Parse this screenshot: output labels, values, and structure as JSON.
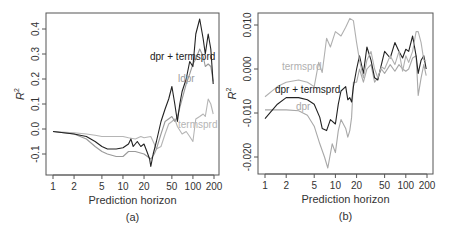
{
  "chart_data": [
    {
      "type": "line",
      "panel_label": "(a)",
      "xlabel": "Prediction horizon",
      "ylabel": "R²",
      "xscale": "log",
      "xlim": [
        1,
        200
      ],
      "ylim": [
        -0.16,
        0.44
      ],
      "xticks": [
        "1",
        "2",
        "5",
        "10",
        "20",
        "50",
        "100",
        "200"
      ],
      "xtick_values": [
        1,
        2,
        5,
        10,
        20,
        50,
        100,
        200
      ],
      "yticks": [
        "-0.1",
        "0.0",
        "0.1",
        "0.2",
        "0.3",
        "0.4"
      ],
      "ytick_values": [
        -0.1,
        0.0,
        0.1,
        0.2,
        0.3,
        0.4
      ],
      "grid": false,
      "series": [
        {
          "name": "dpr + termsprd",
          "color": "#222222",
          "label_pos": [
            150,
            60
          ],
          "points": [
            [
              1,
              -0.01
            ],
            [
              2,
              -0.02
            ],
            [
              3,
              -0.03
            ],
            [
              4,
              -0.05
            ],
            [
              5,
              -0.07
            ],
            [
              6,
              -0.08
            ],
            [
              8,
              -0.08
            ],
            [
              10,
              -0.075
            ],
            [
              12,
              -0.06
            ],
            [
              13,
              -0.04
            ],
            [
              14,
              -0.07
            ],
            [
              16,
              -0.05
            ],
            [
              18,
              -0.07
            ],
            [
              20,
              -0.06
            ],
            [
              22,
              -0.09
            ],
            [
              24,
              -0.12
            ],
            [
              25,
              -0.15
            ],
            [
              27,
              -0.1
            ],
            [
              30,
              -0.05
            ],
            [
              35,
              0.03
            ],
            [
              40,
              0.08
            ],
            [
              45,
              0.12
            ],
            [
              50,
              0.17
            ],
            [
              55,
              0.1
            ],
            [
              60,
              0.03
            ],
            [
              65,
              0.1
            ],
            [
              70,
              0.15
            ],
            [
              80,
              0.2
            ],
            [
              90,
              0.27
            ],
            [
              100,
              0.25
            ],
            [
              110,
              0.38
            ],
            [
              125,
              0.44
            ],
            [
              140,
              0.36
            ],
            [
              150,
              0.3
            ],
            [
              165,
              0.38
            ],
            [
              180,
              0.32
            ],
            [
              195,
              0.18
            ]
          ]
        },
        {
          "name": "ldpr",
          "color": "#9a9a9a",
          "label_pos": [
            178,
            82
          ],
          "points": [
            [
              1,
              -0.01
            ],
            [
              2,
              -0.02
            ],
            [
              3,
              -0.04
            ],
            [
              4,
              -0.07
            ],
            [
              5,
              -0.09
            ],
            [
              6,
              -0.1
            ],
            [
              8,
              -0.11
            ],
            [
              10,
              -0.11
            ],
            [
              12,
              -0.09
            ],
            [
              15,
              -0.09
            ],
            [
              20,
              -0.1
            ],
            [
              25,
              -0.12
            ],
            [
              28,
              -0.1
            ],
            [
              30,
              -0.08
            ],
            [
              35,
              -0.02
            ],
            [
              40,
              0.03
            ],
            [
              50,
              0.05
            ],
            [
              55,
              0.03
            ],
            [
              60,
              0.05
            ],
            [
              70,
              0.12
            ],
            [
              80,
              0.18
            ],
            [
              90,
              0.22
            ],
            [
              100,
              0.26
            ],
            [
              110,
              0.28
            ],
            [
              125,
              0.32
            ],
            [
              140,
              0.29
            ],
            [
              150,
              0.25
            ],
            [
              165,
              0.26
            ],
            [
              180,
              0.25
            ],
            [
              195,
              0.19
            ]
          ]
        },
        {
          "name": "termsprd",
          "color": "#b5b5b5",
          "label_pos": [
            178,
            128
          ],
          "points": [
            [
              1,
              -0.01
            ],
            [
              2,
              -0.015
            ],
            [
              3,
              -0.02
            ],
            [
              4,
              -0.025
            ],
            [
              5,
              -0.03
            ],
            [
              6,
              -0.03
            ],
            [
              8,
              -0.03
            ],
            [
              10,
              -0.03
            ],
            [
              12,
              -0.035
            ],
            [
              15,
              -0.04
            ],
            [
              18,
              -0.03
            ],
            [
              20,
              -0.035
            ],
            [
              25,
              -0.03
            ],
            [
              28,
              -0.06
            ],
            [
              30,
              -0.08
            ],
            [
              35,
              -0.07
            ],
            [
              40,
              -0.02
            ],
            [
              45,
              0.02
            ],
            [
              50,
              0.03
            ],
            [
              55,
              0.04
            ],
            [
              60,
              0.01
            ],
            [
              70,
              -0.02
            ],
            [
              80,
              -0.01
            ],
            [
              90,
              -0.03
            ],
            [
              100,
              -0.05
            ],
            [
              110,
              0.04
            ],
            [
              125,
              0.05
            ],
            [
              140,
              0.06
            ],
            [
              150,
              0.05
            ],
            [
              165,
              0.12
            ],
            [
              180,
              0.1
            ],
            [
              195,
              0.06
            ]
          ]
        }
      ]
    },
    {
      "type": "line",
      "panel_label": "(b)",
      "xlabel": "Prediction horizon",
      "ylabel": "R²",
      "xscale": "log",
      "xlim": [
        1,
        200
      ],
      "ylim": [
        -0.0237,
        0.0127
      ],
      "xticks": [
        "1",
        "2",
        "5",
        "10",
        "20",
        "50",
        "100",
        "200"
      ],
      "xtick_values": [
        1,
        2,
        5,
        10,
        20,
        50,
        100,
        200
      ],
      "yticks": [
        "-0.020",
        "-0.010",
        "0.000",
        "0.010"
      ],
      "ytick_values": [
        -0.02,
        -0.01,
        0.0,
        0.01
      ],
      "grid": false,
      "series": [
        {
          "name": "termsprd",
          "color": "#b0b0b0",
          "label_pos": [
            282,
            70
          ],
          "points": [
            [
              1,
              -0.0063
            ],
            [
              1.5,
              -0.004
            ],
            [
              2,
              -0.003
            ],
            [
              3,
              -0.0025
            ],
            [
              4,
              -0.003
            ],
            [
              5,
              -0.004
            ],
            [
              5.8,
              0.0015
            ],
            [
              6.5,
              -0.0008
            ],
            [
              7.5,
              0.007
            ],
            [
              8.5,
              0.005
            ],
            [
              10,
              0.0085
            ],
            [
              12,
              0.0075
            ],
            [
              14,
              0.0095
            ],
            [
              16,
              0.0115
            ],
            [
              18,
              0.011
            ],
            [
              20,
              0.006
            ],
            [
              22,
              0.002
            ],
            [
              25,
              -0.002
            ],
            [
              28,
              0.002
            ],
            [
              32,
              0.004
            ],
            [
              36,
              0.0
            ],
            [
              40,
              -0.002
            ],
            [
              45,
              0.0005
            ],
            [
              50,
              0.0
            ],
            [
              60,
              0.003
            ],
            [
              70,
              0.001
            ],
            [
              80,
              0.004
            ],
            [
              90,
              -0.0005
            ],
            [
              100,
              0.003
            ],
            [
              110,
              0.0015
            ],
            [
              125,
              0.004
            ],
            [
              140,
              0.0085
            ],
            [
              150,
              0.0085
            ],
            [
              165,
              0.006
            ],
            [
              180,
              0.002
            ],
            [
              195,
              0.002
            ]
          ]
        },
        {
          "name": "dpr + termsprd",
          "color": "#222222",
          "label_pos": [
            275,
            93
          ],
          "points": [
            [
              1,
              -0.0113
            ],
            [
              1.5,
              -0.008
            ],
            [
              2,
              -0.0065
            ],
            [
              3,
              -0.0065
            ],
            [
              4,
              -0.007
            ],
            [
              5,
              -0.008
            ],
            [
              6,
              -0.011
            ],
            [
              6.5,
              -0.0135
            ],
            [
              7.5,
              -0.014
            ],
            [
              8.5,
              -0.0115
            ],
            [
              10,
              -0.0125
            ],
            [
              11,
              -0.008
            ],
            [
              12,
              -0.005
            ],
            [
              14,
              -0.004
            ],
            [
              15,
              -0.007
            ],
            [
              16,
              -0.0065
            ],
            [
              17,
              -0.0075
            ],
            [
              18,
              -0.004
            ],
            [
              20,
              0.0
            ],
            [
              22,
              0.003
            ],
            [
              25,
              -0.001
            ],
            [
              28,
              0.005
            ],
            [
              32,
              0.002
            ],
            [
              36,
              -0.002
            ],
            [
              40,
              -0.0025
            ],
            [
              45,
              0.001
            ],
            [
              50,
              0.004
            ],
            [
              60,
              0.0025
            ],
            [
              70,
              0.006
            ],
            [
              80,
              0.004
            ],
            [
              90,
              0.0025
            ],
            [
              100,
              0.0045
            ],
            [
              110,
              0.004
            ],
            [
              125,
              0.0075
            ],
            [
              140,
              0.003
            ],
            [
              150,
              -0.001
            ],
            [
              165,
              0.002
            ],
            [
              180,
              0.003
            ],
            [
              195,
              0.0
            ]
          ]
        },
        {
          "name": "dpr",
          "color": "#a8a8a8",
          "label_pos": [
            296,
            110
          ],
          "points": [
            [
              1,
              -0.0093
            ],
            [
              1.5,
              -0.0093
            ],
            [
              2,
              -0.0093
            ],
            [
              3,
              -0.0095
            ],
            [
              4,
              -0.0105
            ],
            [
              5,
              -0.013
            ],
            [
              6,
              -0.017
            ],
            [
              7,
              -0.02
            ],
            [
              7.8,
              -0.0225
            ],
            [
              9,
              -0.017
            ],
            [
              10,
              -0.019
            ],
            [
              11,
              -0.014
            ],
            [
              12,
              -0.0115
            ],
            [
              14,
              -0.0135
            ],
            [
              15,
              -0.0155
            ],
            [
              16,
              -0.014
            ],
            [
              17,
              -0.011
            ],
            [
              18,
              -0.003
            ],
            [
              20,
              -0.003
            ],
            [
              22,
              0.0
            ],
            [
              25,
              -0.003
            ],
            [
              28,
              0.0
            ],
            [
              32,
              0.001
            ],
            [
              36,
              -0.003
            ],
            [
              40,
              -0.002
            ],
            [
              45,
              0.0
            ],
            [
              50,
              -0.001
            ],
            [
              60,
              0.001
            ],
            [
              70,
              -0.0005
            ],
            [
              80,
              0.001
            ],
            [
              90,
              0.0
            ],
            [
              100,
              -0.0005
            ],
            [
              110,
              0.0
            ],
            [
              125,
              0.0025
            ],
            [
              140,
              0.003
            ],
            [
              150,
              -0.006
            ],
            [
              165,
              -0.002
            ],
            [
              180,
              0.001
            ],
            [
              195,
              -0.0015
            ]
          ]
        }
      ]
    }
  ],
  "panels": [
    {
      "frame": {
        "left": 46,
        "top": 13,
        "right": 219,
        "bottom": 175
      },
      "x_px": {
        "1": 53,
        "200": 214
      },
      "y_px_ref": {
        "v0": 0.0,
        "p0": 129,
        "v1": 0.4,
        "p1": 29
      }
    },
    {
      "frame": {
        "left": 258,
        "top": 13,
        "right": 433,
        "bottom": 174
      },
      "x_px": {
        "1": 265,
        "200": 427
      },
      "y_px_ref": {
        "v0": 0.0,
        "p0": 69,
        "v1": 0.01,
        "p1": 25
      }
    }
  ]
}
